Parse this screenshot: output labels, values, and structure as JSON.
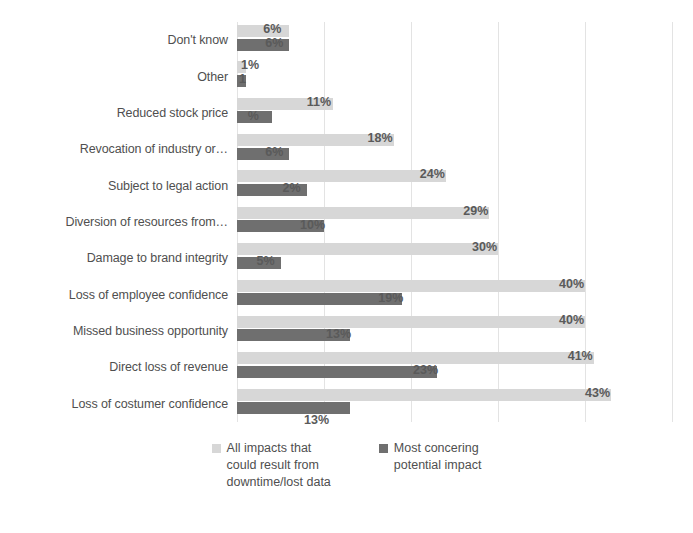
{
  "chart_data": {
    "type": "bar",
    "orientation": "horizontal",
    "title": "",
    "xlabel": "",
    "ylabel": "",
    "xlim": [
      0,
      50
    ],
    "grid": true,
    "gridline_step": 10,
    "legend_position": "bottom",
    "categories": [
      "Don't know",
      "Other",
      "Reduced stock price",
      "Revocation of industry or…",
      "Subject to legal action",
      "Diversion of resources from…",
      "Damage to brand integrity",
      "Loss of employee confidence",
      "Missed business opportunity",
      "Direct loss of revenue",
      "Loss of costumer confidence"
    ],
    "series": [
      {
        "name": "All impacts that could result from downtime/lost data",
        "legend_label": "All impacts that\ncould result from\ndowntime/lost data",
        "color": "#d7d7d7",
        "values": [
          6,
          1,
          11,
          18,
          24,
          29,
          30,
          40,
          40,
          41,
          43
        ],
        "value_labels": [
          "6%",
          "1%",
          "11%",
          "18%",
          "24%",
          "29%",
          "30%",
          "40%",
          "40%",
          "41%",
          "43%"
        ]
      },
      {
        "name": "Most concering potential impact",
        "legend_label": "Most concering\npotential impact",
        "color": "#6f6f6f",
        "values": [
          6,
          1,
          4,
          6,
          8,
          10,
          5,
          19,
          13,
          23,
          13
        ],
        "value_labels": [
          "6%",
          "1",
          "%",
          "6%",
          "2%",
          "10%",
          "5%",
          "19%",
          "13%",
          "23%",
          "13%"
        ]
      }
    ]
  },
  "legend": {
    "items": [
      {
        "label": "All impacts that\ncould result from\ndowntime/lost data",
        "swatch": "light"
      },
      {
        "label": "Most concering\npotential impact",
        "swatch": "dark"
      }
    ]
  }
}
